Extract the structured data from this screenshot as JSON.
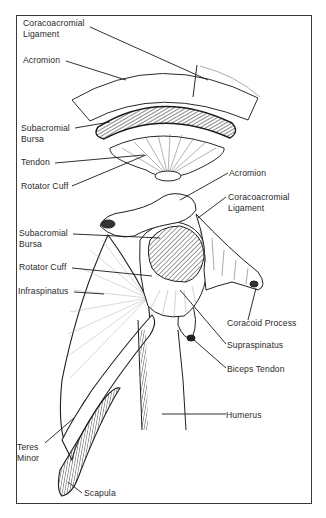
{
  "diagram": {
    "exploded_view": {
      "labels": {
        "coracoacromial_ligament_l1": "Coracoacromial",
        "coracoacromial_ligament_l2": "Ligament",
        "acromion": "Acromion",
        "subacromial_bursa_l1": "Subacromial",
        "subacromial_bursa_l2": "Bursa",
        "tendon": "Tendon",
        "rotator_cuff": "Rotator Cuff"
      }
    },
    "assembled_view": {
      "labels": {
        "acromion": "Acromion",
        "coracoacromial_ligament_l1": "Coracoacromial",
        "coracoacromial_ligament_l2": "Ligament",
        "subacromial_bursa_l1": "Subacromial",
        "subacromial_bursa_l2": "Bursa",
        "rotator_cuff": "Rotator Cuff",
        "infraspinatus": "Infraspinatus",
        "coracoid_process": "Coracoid Process",
        "supraspinatus": "Supraspinatus",
        "biceps_tendon": "Biceps Tendon",
        "humerus": "Humerus",
        "teres_minor_l1": "Teres",
        "teres_minor_l2": "Minor",
        "scapula": "Scapula"
      }
    },
    "colors": {
      "line": "#2a2a2a",
      "background": "#ffffff",
      "border": "#3a3a3a"
    }
  }
}
